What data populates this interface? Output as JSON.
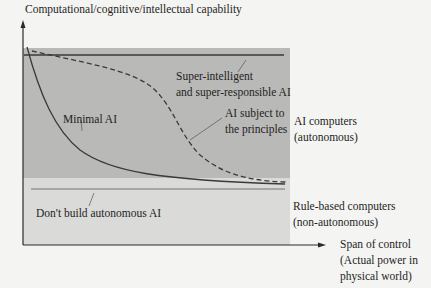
{
  "diagram": {
    "y_axis_label": "Computational/cognitive/intellectual capability",
    "x_axis_label_line1": "Span of control",
    "x_axis_label_line2": "(Actual power in",
    "x_axis_label_line3": "physical world)",
    "regions": {
      "autonomous": {
        "label_line1": "AI computers",
        "label_line2": "(autonomous)",
        "color": "#b9b9b7"
      },
      "rule_based": {
        "label_line1": "Rule-based computers",
        "label_line2": "(non-autonomous)",
        "color": "#dadad8"
      }
    },
    "curves": {
      "super": {
        "label_line1": "Super-intelligent",
        "label_line2": "and super-responsible AI",
        "style": "solid-horizontal"
      },
      "minimal": {
        "label": "Minimal AI",
        "style": "solid"
      },
      "principles": {
        "label_line1": "AI subject to",
        "label_line2": "the principles",
        "style": "dashed"
      },
      "dont_build": {
        "label": "Don't build autonomous AI",
        "style": "solid-horizontal"
      }
    },
    "colors": {
      "line": "#3a3a3a",
      "axis": "#2a2a2a",
      "background": "#f4f4f2"
    }
  }
}
